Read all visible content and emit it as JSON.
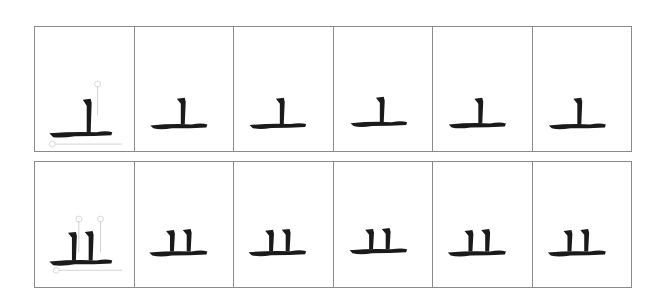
{
  "worksheet": {
    "rows": [
      {
        "glyph_name": "丄-component",
        "annotations": [
          "①",
          "②"
        ],
        "cell_count": 6
      },
      {
        "glyph_name": "业-bottom-component",
        "annotations": [
          "①",
          "②",
          "③"
        ],
        "cell_count": 6
      }
    ],
    "colors": {
      "ink": "#1a1a1a",
      "grid": "#8a8a8a",
      "annotation": "#c8c8c8"
    }
  }
}
